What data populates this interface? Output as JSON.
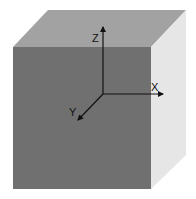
{
  "diagram": {
    "type": "3d-cube-with-coordinate-axes",
    "colors": {
      "background": "#ffffff",
      "front_face": "#707070",
      "top_face": "#a2a2a2",
      "right_face": "#e6e6e6",
      "axis": "#111111"
    },
    "axes": [
      {
        "name": "x",
        "label": "X"
      },
      {
        "name": "y",
        "label": "Y"
      },
      {
        "name": "z",
        "label": "Z"
      }
    ]
  }
}
